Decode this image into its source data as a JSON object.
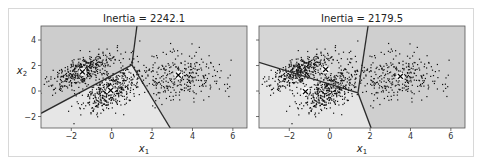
{
  "chart_data": [
    {
      "type": "scatter",
      "title": "Inertia = 2242.1",
      "xlabel": "x1",
      "ylabel": "x2",
      "xlim": [
        -3.5,
        6.7
      ],
      "ylim": [
        -2.9,
        5.1
      ],
      "xticks": [
        -2,
        0,
        2,
        4,
        6
      ],
      "yticks": [
        -2,
        0,
        2,
        4
      ],
      "grid": false,
      "centroids": [
        [
          -1.45,
          1.5
        ],
        [
          -0.05,
          0.05
        ],
        [
          3.3,
          1.25
        ]
      ],
      "voronoi": {
        "junction": [
          1.0,
          2.05
        ],
        "edges": [
          [
            1.25,
            5.1
          ],
          [
            2.9,
            -2.9
          ],
          [
            -3.5,
            -1.75
          ]
        ]
      },
      "regions": [
        {
          "name": "top-left",
          "color": "#cdcdcd",
          "polygon": [
            [
              -3.5,
              5.1
            ],
            [
              1.25,
              5.1
            ],
            [
              1.0,
              2.05
            ],
            [
              -3.5,
              -1.75
            ]
          ]
        },
        {
          "name": "right",
          "color": "#d2d2d2",
          "polygon": [
            [
              1.25,
              5.1
            ],
            [
              6.7,
              5.1
            ],
            [
              6.7,
              -2.9
            ],
            [
              2.9,
              -2.9
            ],
            [
              1.0,
              2.05
            ]
          ]
        },
        {
          "name": "bottom",
          "color": "#e6e6e6",
          "polygon": [
            [
              -3.5,
              -1.75
            ],
            [
              1.0,
              2.05
            ],
            [
              2.9,
              -2.9
            ],
            [
              -3.5,
              -2.9
            ]
          ]
        }
      ]
    },
    {
      "type": "scatter",
      "title": "Inertia = 2179.5",
      "xlabel": "x1",
      "ylabel": "",
      "xlim": [
        -3.5,
        6.7
      ],
      "ylim": [
        -2.9,
        5.1
      ],
      "xticks": [
        -2,
        0,
        2,
        4,
        6
      ],
      "yticks": [
        -2,
        0,
        2,
        4
      ],
      "grid": false,
      "centroids": [
        [
          -0.2,
          1.7
        ],
        [
          -1.2,
          -0.05
        ],
        [
          3.5,
          1.15
        ]
      ],
      "voronoi": {
        "junction": [
          1.4,
          -0.15
        ],
        "edges": [
          [
            1.9,
            5.1
          ],
          [
            2.05,
            -2.9
          ],
          [
            -3.5,
            2.25
          ]
        ]
      },
      "regions": [
        {
          "name": "top-left",
          "color": "#d6d6d6",
          "polygon": [
            [
              -3.5,
              5.1
            ],
            [
              1.9,
              5.1
            ],
            [
              1.4,
              -0.15
            ],
            [
              -3.5,
              2.25
            ]
          ]
        },
        {
          "name": "right",
          "color": "#cfcfcf",
          "polygon": [
            [
              1.9,
              5.1
            ],
            [
              6.7,
              5.1
            ],
            [
              6.7,
              -2.9
            ],
            [
              2.05,
              -2.9
            ],
            [
              1.4,
              -0.15
            ]
          ]
        },
        {
          "name": "bottom-left",
          "color": "#e6e6e6",
          "polygon": [
            [
              -3.5,
              2.25
            ],
            [
              1.4,
              -0.15
            ],
            [
              2.05,
              -2.9
            ],
            [
              -3.5,
              -2.9
            ]
          ]
        }
      ]
    }
  ],
  "data_clusters": [
    {
      "center": [
        -1.4,
        1.6
      ],
      "spread": [
        0.8,
        0.75
      ],
      "corr": 0.65,
      "n": 420
    },
    {
      "center": [
        -0.1,
        0.0
      ],
      "spread": [
        0.75,
        0.9
      ],
      "corr": 0.6,
      "n": 420
    },
    {
      "center": [
        3.3,
        1.1
      ],
      "spread": [
        1.1,
        0.9
      ],
      "corr": 0.05,
      "n": 330
    }
  ],
  "labels": {
    "left_title": "Inertia = 2242.1",
    "right_title": "Inertia = 2179.5",
    "x_axis": "x",
    "x_sub": "1",
    "y_axis": "x",
    "y_sub": "2",
    "xtick_labels": [
      "−2",
      "0",
      "2",
      "4",
      "6"
    ],
    "ytick_labels": [
      "−2",
      "0",
      "2",
      "4"
    ]
  }
}
